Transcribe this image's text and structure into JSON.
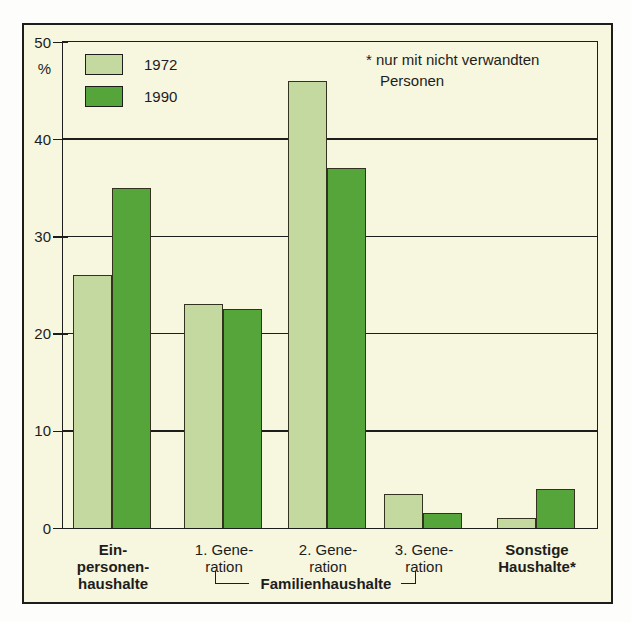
{
  "colors": {
    "figure_background": "#f7f6df",
    "outer_background": "#ffffff",
    "line": "#1d1d1b",
    "bar_1972": "#c4d99f",
    "bar_1990": "#55a53a"
  },
  "chart_data": {
    "type": "bar",
    "title": "",
    "xlabel": "",
    "ylabel": "%",
    "ylim": [
      0,
      50
    ],
    "yticks": [
      0,
      10,
      20,
      30,
      40,
      50
    ],
    "grid": true,
    "legend_position": "top-left",
    "categories": [
      "Einpersonenhaushalte",
      "1. Generation",
      "2. Generation",
      "3. Generation",
      "Sonstige Haushalte*"
    ],
    "category_display": [
      {
        "lines": [
          "Ein-",
          "personen-",
          "haushalte"
        ],
        "bold": true
      },
      {
        "lines": [
          "1. Gene-",
          "ration"
        ],
        "bold": false
      },
      {
        "lines": [
          "2. Gene-",
          "ration"
        ],
        "bold": false
      },
      {
        "lines": [
          "3. Gene-",
          "ration"
        ],
        "bold": false
      },
      {
        "lines": [
          "Sonstige",
          "Haushalte*"
        ],
        "bold": true
      }
    ],
    "series": [
      {
        "name": "1972",
        "color": "#c4d99f",
        "values": [
          26,
          23,
          46,
          3.5,
          1
        ]
      },
      {
        "name": "1990",
        "color": "#55a53a",
        "values": [
          35,
          22.5,
          37,
          1.5,
          4
        ]
      }
    ],
    "annotation": "* nur mit nicht verwandten Personen",
    "annotation_lines": [
      "* nur mit nicht verwandten",
      "Personen"
    ],
    "bracket": {
      "label": "Familienhaushalte",
      "from_category": 1,
      "to_category": 3
    }
  }
}
